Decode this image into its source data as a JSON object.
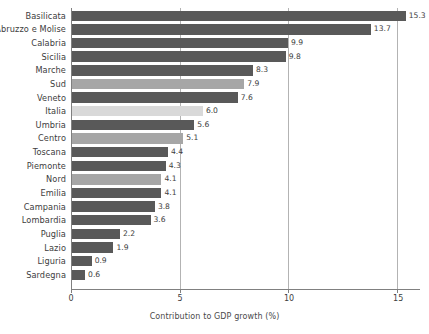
{
  "chart_data": {
    "type": "bar",
    "orientation": "horizontal",
    "title": "",
    "xlabel": "Contribution to GDP growth (%)",
    "ylabel": "",
    "xlim": [
      0,
      16
    ],
    "xticks": [
      0,
      5,
      10,
      15
    ],
    "xtick_labels": [
      "0",
      "5",
      "10",
      "15"
    ],
    "grid": true,
    "grid_axis": "x",
    "legend": "none",
    "categories": [
      "Basilicata",
      "Abruzzo e Molise",
      "Calabria",
      "Sicilia",
      "Marche",
      "Sud",
      "Veneto",
      "Italia",
      "Umbria",
      "Centro",
      "Toscana",
      "Piemonte",
      "Nord",
      "Emilia",
      "Campania",
      "Lombardia",
      "Puglia",
      "Lazio",
      "Liguria",
      "Sardegna"
    ],
    "values": [
      15.3,
      13.7,
      9.9,
      9.8,
      8.3,
      7.9,
      7.6,
      6.0,
      5.6,
      5.1,
      4.4,
      4.3,
      4.1,
      4.1,
      3.8,
      3.6,
      2.2,
      1.9,
      0.9,
      0.6
    ],
    "value_labels": [
      "15.3",
      "13.7",
      "9.9",
      "9.8",
      "8.3",
      "7.9",
      "7.6",
      "6.0",
      "5.6",
      "5.1",
      "4.4",
      "4.3",
      "4.1",
      "4.1",
      "3.8",
      "3.6",
      "2.2",
      "1.9",
      "0.9",
      "0.6"
    ],
    "bar_kinds": [
      "region",
      "region",
      "region",
      "region",
      "region",
      "macro-area",
      "region",
      "national",
      "region",
      "macro-area",
      "region",
      "region",
      "macro-area",
      "region",
      "region",
      "region",
      "region",
      "region",
      "region",
      "region"
    ]
  },
  "colors": {
    "bar_region": "#595959",
    "bar_macro_area": "#a6a6a6",
    "bar_national": "#d9d9d9",
    "gridline": "#b3b3b3",
    "axis": "#808080",
    "text": "#3d3d3d",
    "background": "#ffffff"
  }
}
